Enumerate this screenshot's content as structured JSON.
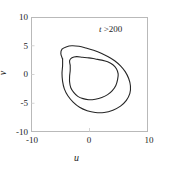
{
  "chart_data": {
    "type": "line",
    "title": "",
    "subtitle": "",
    "xlabel": "u",
    "ylabel": "v",
    "xlim": [
      -10,
      10
    ],
    "ylim": [
      -10,
      10
    ],
    "xticks": [
      "-10",
      "0",
      "10"
    ],
    "xtick_values": [
      -10,
      0,
      10
    ],
    "yticks": [
      "10",
      "5",
      "0",
      "-5",
      "-10"
    ],
    "ytick_values": [
      10,
      5,
      0,
      -5,
      -10
    ],
    "grid": false,
    "legend": null,
    "annotations": [
      {
        "text_var": "t",
        "text_rest": " >200",
        "text_full": "t >200",
        "x": 5.0,
        "y": 8.3
      }
    ],
    "line_color": "#262626",
    "line_width": 1.1,
    "series": [
      {
        "name": "outer-loop",
        "description": "outer branch of period-2 limit cycle in the u-v phase plane",
        "points": [
          [
            -4.6,
            2.7
          ],
          [
            -4.9,
            3.6
          ],
          [
            -4.7,
            4.4
          ],
          [
            -4.0,
            4.8
          ],
          [
            -3.0,
            5.0
          ],
          [
            -1.8,
            4.9
          ],
          [
            -0.6,
            4.6
          ],
          [
            0.7,
            4.2
          ],
          [
            2.0,
            3.7
          ],
          [
            3.2,
            3.1
          ],
          [
            4.3,
            2.4
          ],
          [
            5.3,
            1.5
          ],
          [
            6.1,
            0.5
          ],
          [
            6.7,
            -0.7
          ],
          [
            7.0,
            -2.0
          ],
          [
            6.9,
            -3.3
          ],
          [
            6.3,
            -4.5
          ],
          [
            5.3,
            -5.5
          ],
          [
            4.0,
            -6.2
          ],
          [
            2.5,
            -6.6
          ],
          [
            1.0,
            -6.6
          ],
          [
            -0.4,
            -6.3
          ],
          [
            -1.7,
            -5.7
          ],
          [
            -2.8,
            -4.8
          ],
          [
            -3.7,
            -3.7
          ],
          [
            -4.3,
            -2.5
          ],
          [
            -4.6,
            -1.2
          ],
          [
            -4.7,
            0.2
          ],
          [
            -4.6,
            1.5
          ],
          [
            -4.6,
            2.7
          ]
        ]
      },
      {
        "name": "inner-loop",
        "description": "inner branch of period-2 limit cycle in the u-v phase plane",
        "points": [
          [
            -3.3,
            1.6
          ],
          [
            -3.4,
            2.4
          ],
          [
            -3.0,
            2.9
          ],
          [
            -2.2,
            3.1
          ],
          [
            -1.2,
            3.0
          ],
          [
            -0.1,
            2.9
          ],
          [
            1.0,
            2.7
          ],
          [
            2.1,
            2.5
          ],
          [
            3.1,
            2.2
          ],
          [
            4.0,
            1.7
          ],
          [
            4.6,
            1.0
          ],
          [
            4.9,
            0.1
          ],
          [
            4.8,
            -0.9
          ],
          [
            4.5,
            -1.9
          ],
          [
            3.9,
            -2.8
          ],
          [
            3.1,
            -3.5
          ],
          [
            2.1,
            -4.0
          ],
          [
            1.0,
            -4.3
          ],
          [
            -0.1,
            -4.4
          ],
          [
            -1.1,
            -4.2
          ],
          [
            -2.0,
            -3.8
          ],
          [
            -2.7,
            -3.1
          ],
          [
            -3.2,
            -2.3
          ],
          [
            -3.4,
            -1.3
          ],
          [
            -3.4,
            -0.3
          ],
          [
            -3.3,
            0.7
          ],
          [
            -3.3,
            1.6
          ]
        ]
      }
    ],
    "crossing_points": [
      [
        4.6,
        2.2
      ]
    ]
  },
  "figure": {
    "background_color": "#ffffff",
    "frame_color": "#b9b9b9",
    "text_color": "#1d1d1d"
  }
}
